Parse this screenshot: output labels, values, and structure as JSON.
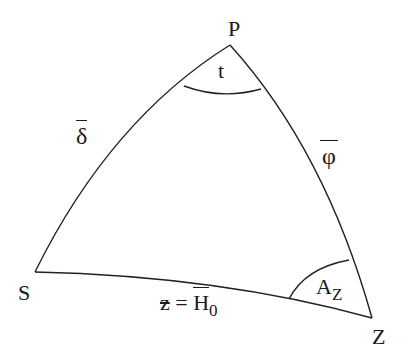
{
  "diagram": {
    "vertices": {
      "pole": {
        "label": "P"
      },
      "star": {
        "label": "S"
      },
      "zenith": {
        "label": "Z"
      }
    },
    "angles": {
      "hour_angle": {
        "label": "t"
      },
      "azimuth": {
        "label": "A",
        "subscript": "Z"
      }
    },
    "sides": {
      "polar_distance": {
        "label": "δ",
        "overline": true
      },
      "colatitude": {
        "label": "φ",
        "overline": true
      },
      "zenith_distance": {
        "prefix": "z = ",
        "label": "H",
        "subscript": "0",
        "overline": true
      }
    },
    "colors": {
      "line": "#222222",
      "background": "#ffffff"
    }
  }
}
